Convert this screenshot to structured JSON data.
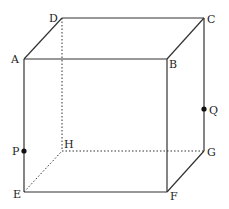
{
  "diagram": {
    "type": "cube",
    "line_color": "#333333",
    "hidden_line_style": "dotted",
    "vertices": {
      "A": {
        "label": "A",
        "x": 24,
        "y": 59
      },
      "B": {
        "label": "B",
        "x": 167,
        "y": 59
      },
      "C": {
        "label": "C",
        "x": 204,
        "y": 18
      },
      "D": {
        "label": "D",
        "x": 62,
        "y": 18
      },
      "E": {
        "label": "E",
        "x": 24,
        "y": 192
      },
      "F": {
        "label": "F",
        "x": 167,
        "y": 192
      },
      "G": {
        "label": "G",
        "x": 204,
        "y": 151
      },
      "H": {
        "label": "H",
        "x": 62,
        "y": 151
      }
    },
    "points": {
      "P": {
        "label": "P",
        "on_edge": "AE",
        "x": 24,
        "y": 151
      },
      "Q": {
        "label": "Q",
        "on_edge": "CG",
        "x": 204,
        "y": 109
      }
    },
    "visible_edges": [
      "AB",
      "BC",
      "CD",
      "DA",
      "AE",
      "BF",
      "CG",
      "EF",
      "FG"
    ],
    "hidden_edges": [
      "DH",
      "EH",
      "HG"
    ]
  }
}
